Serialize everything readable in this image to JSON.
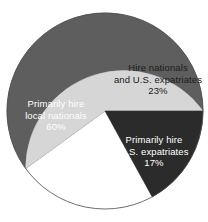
{
  "chart_data": {
    "type": "pie",
    "title": "",
    "subtitle": "",
    "xlabel": "",
    "ylabel": "",
    "legend_position": "none",
    "grid": false,
    "labels_inside_slices": true,
    "categories": [
      "Primarily hire local nationals",
      "Hire nationals and U.S. expatriates",
      "Primarily hire U.S. expatriates"
    ],
    "values": [
      60,
      23,
      17
    ],
    "value_suffix": "%",
    "colors": [
      "#5e5e5e",
      "#d6d6d6",
      "#2b2b2b"
    ],
    "slices": [
      {
        "name": "primarily-hire-local-nationals",
        "value": 60,
        "value_text": "60%",
        "color": "#5e5e5e",
        "text_color": "#ffffff",
        "lines": [
          "Primarily hire",
          "local nationals",
          "60%"
        ]
      },
      {
        "name": "hire-nationals-and-us-expatriates",
        "value": 23,
        "value_text": "23%",
        "color": "#d6d6d6",
        "text_color": "#1b1b1b",
        "lines": [
          "Hire nationals",
          "and U.S. expatriates",
          "23%"
        ]
      },
      {
        "name": "primarily-hire-us-expatriates",
        "value": 17,
        "value_text": "17%",
        "color": "#2b2b2b",
        "text_color": "#ffffff",
        "lines": [
          "Primarily hire",
          "U.S. expatriates",
          "17%"
        ]
      }
    ]
  },
  "labels": {
    "local": {
      "line1": "Primarily hire",
      "line2": "local nationals",
      "line3": "60%"
    },
    "both": {
      "line1": "Hire nationals",
      "line2": "and U.S. expatriates",
      "line3": "23%"
    },
    "expat": {
      "line1": "Primarily hire",
      "line2": "U.S. expatriates",
      "line3": "17%"
    }
  },
  "geometry": {
    "center_x": 105,
    "center_y": 111,
    "radius": 98
  }
}
